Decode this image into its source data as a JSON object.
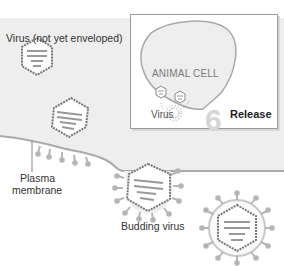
{
  "diagram": {
    "labels": {
      "virus_not_enveloped": "Virus (not yet enveloped)",
      "plasma_membrane_line1": "Plasma",
      "plasma_membrane_line2": "membrane",
      "budding_virus": "Budding virus"
    },
    "inset": {
      "cell_label": "ANIMAL CELL",
      "virus_label": "Virus",
      "step_number": "6",
      "step_label": "Release"
    },
    "colors": {
      "cytoplasm": "#eeeeee",
      "membrane": "#aaaaaa",
      "capsid_outline": "#777777",
      "spikes": "#b5b5b5",
      "step_number": "#d6d6d6"
    }
  }
}
